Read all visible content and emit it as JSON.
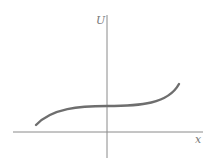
{
  "diagram": {
    "type": "potential-energy-curve",
    "axes": {
      "y_label": "U",
      "x_label": "x"
    },
    "colors": {
      "axis": "#8a8a8a",
      "curve": "#6e6e6e",
      "label": "#777777",
      "background": "#ffffff"
    },
    "curve_description": "cubic-like curve rising from lower left, flattening (inflection) at the U axis, then rising to upper right"
  }
}
